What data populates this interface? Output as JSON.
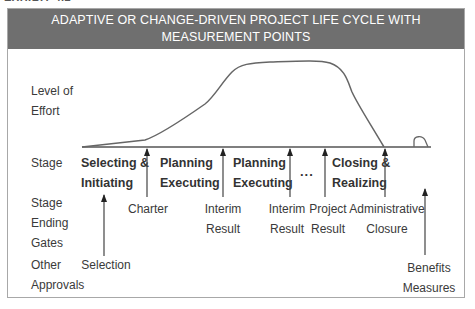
{
  "exhibit_label": "EXHIBIT 4.2",
  "header": {
    "title_line1": "ADAPTIVE OR CHANGE-DRIVEN PROJECT LIFE CYCLE WITH",
    "title_line2": "MEASUREMENT POINTS"
  },
  "row_labels": {
    "effort": "Level of\nEffort",
    "stage": "Stage",
    "gates": "Stage\nEnding\nGates",
    "approvals": "Other\nApprovals"
  },
  "stages": [
    {
      "label": "Selecting &\nInitiating"
    },
    {
      "label": "Planning\nExecuting"
    },
    {
      "label": "Planning\nExecuting"
    },
    {
      "label": "Closing &\nRealizing"
    }
  ],
  "ellipsis": "...",
  "gates": [
    {
      "label": "Charter"
    },
    {
      "label": "Interim\nResult"
    },
    {
      "label": "Interim\nResult"
    },
    {
      "label": "Project\nResult"
    },
    {
      "label": "Administrative\nClosure"
    }
  ],
  "approvals": [
    {
      "label": "Selection"
    },
    {
      "label": "Benefits\nMeasures"
    }
  ],
  "colors": {
    "header_bg": "#6f6f6f",
    "header_text": "#ffffff",
    "line": "#555555",
    "border": "#a8a8a8"
  }
}
